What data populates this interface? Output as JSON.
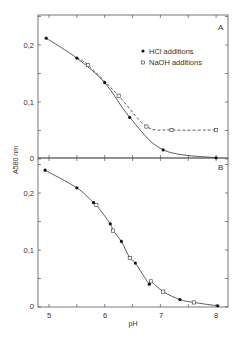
{
  "chart_data": [
    {
      "panel": "A",
      "type": "line",
      "title": "",
      "xlabel": "pH",
      "ylabel": "A580 nm",
      "xlim": [
        4.8,
        8.2
      ],
      "ylim": [
        0,
        0.25
      ],
      "yticks": [
        "0",
        "0,1",
        "0,2"
      ],
      "grid": false,
      "legend_position": "upper right",
      "series": [
        {
          "name": "HCl additions",
          "marker": "filled-circle",
          "line": "solid",
          "x": [
            4.95,
            5.5,
            6.0,
            6.45,
            7.05,
            8.0
          ],
          "y": [
            0.212,
            0.177,
            0.134,
            0.073,
            0.016,
            0.002
          ]
        },
        {
          "name": "NaOH additions",
          "marker": "open-square",
          "line": "dashed",
          "x": [
            5.7,
            6.25,
            6.75,
            7.2,
            8.0
          ],
          "y": [
            0.165,
            0.111,
            0.057,
            0.051,
            0.051
          ]
        }
      ]
    },
    {
      "panel": "B",
      "type": "line",
      "xlabel": "pH",
      "ylabel": "A580 nm",
      "xlim": [
        4.8,
        8.2
      ],
      "ylim": [
        0,
        0.25
      ],
      "xticks": [
        "5",
        "6",
        "7",
        "8"
      ],
      "yticks": [
        "0",
        "0,1",
        "0,2"
      ],
      "grid": false,
      "series": [
        {
          "name": "HCl additions",
          "marker": "filled-circle",
          "x": [
            4.93,
            5.5,
            5.8,
            6.1,
            6.3,
            6.55,
            6.8,
            7.35,
            8.03
          ],
          "y": [
            0.24,
            0.209,
            0.183,
            0.146,
            0.115,
            0.077,
            0.04,
            0.013,
            0.002
          ]
        },
        {
          "name": "NaOH additions",
          "marker": "open-square",
          "x": [
            5.85,
            6.15,
            6.45,
            6.83,
            7.05,
            7.6
          ],
          "y": [
            0.179,
            0.134,
            0.086,
            0.045,
            0.027,
            0.008
          ]
        }
      ]
    }
  ],
  "labels": {
    "panel_a": "A",
    "panel_b": "B",
    "legend_hcl": "HCl additions",
    "legend_naoh": "NaOH additions",
    "xlabel": "pH",
    "ylabel": "A580 nm",
    "ytick_0": "0",
    "ytick_01": "0,1",
    "ytick_02": "0,2",
    "xtick_5": "5",
    "xtick_6": "6",
    "xtick_7": "7",
    "xtick_8": "8"
  }
}
